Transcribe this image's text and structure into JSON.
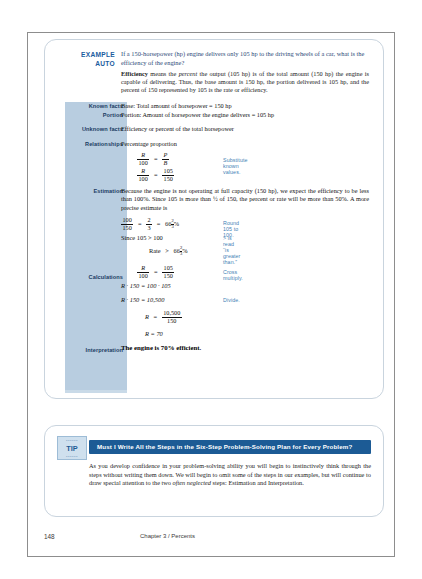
{
  "page": {
    "number": "148",
    "chapter_line": "Chapter 3 / Percents"
  },
  "example": {
    "tag_line1": "EXAMPLE",
    "tag_line2": "AUTO",
    "question": "If a 150-horsepower (hp) engine delivers only 105 hp to the driving wheels of a car, what is the efficiency of the engine?",
    "intro_bold": "Efficiency",
    "intro_rest_a": " means the ",
    "intro_italic": "percent",
    "intro_rest_b": " the output (105 hp) is of the total amount (150 hp) the engine is capable of delivering. Thus, the base amount is 150 hp, the portion delivered is 105 hp, and the percent of 150 represented by 105 is the rate or efficiency.",
    "labels": {
      "known_facts": "Known facts",
      "portion": "Portion",
      "unknown_facts": "Unknown facts",
      "relationships": "Relationships",
      "estimation": "Estimation",
      "calculations": "Calculations",
      "interpretation": "Interpretation"
    },
    "known_facts_text": "Base: Total amount of horsepower = 150 hp",
    "portion_text": "Portion: Amount of horsepower the engine delivers = 105 hp",
    "unknown_facts_text": "Efficiency or percent of the total horsepower",
    "relationships_text": "Percentage proportion",
    "proportion_1": {
      "left_num": "R",
      "left_den": "100",
      "eq": "=",
      "right_num": "P",
      "right_den": "B"
    },
    "proportion_2": {
      "left_num": "R",
      "left_den": "100",
      "eq": "=",
      "right_num": "105",
      "right_den": "150"
    },
    "note_substitute": "Substitute known values.",
    "estimation_text": "Because the engine is not operating at full capacity (150 hp), we expect the efficiency to be less than 100%. Since 105 is more than ½ of 150, the percent or rate will be more than 50%. A more precise estimate is",
    "estimate_eq": {
      "a_num": "100",
      "a_den": "150",
      "eq1": "=",
      "b_num": "2",
      "b_den": "3",
      "eq2": "=",
      "whole": "66",
      "m_num": "2",
      "m_den": "3",
      "pct": "%"
    },
    "note_round": "Round 105 to 100.",
    "since_line": "Since 105 > 100",
    "note_greater": "> is read “is greater than.”",
    "rate_line": {
      "label": "Rate",
      "gt": ">",
      "whole": "66",
      "m_num": "2",
      "m_den": "3",
      "pct": "%"
    },
    "calc_proportion": {
      "left_num": "R",
      "left_den": "100",
      "eq": "=",
      "right_num": "105",
      "right_den": "150"
    },
    "note_cross": "Cross multiply.",
    "calc_line_1": "R · 150 = 100 · 105",
    "calc_line_2": "R · 150 = 10,500",
    "note_divide": "Divide.",
    "calc_frac": {
      "var": "R",
      "eq": "=",
      "num": "10,500",
      "den": "150"
    },
    "calc_result": "R = 70",
    "interpretation_text": "The engine is 70% efficient."
  },
  "tip": {
    "badge_word": "TIP",
    "badge_tick_top": "••••••",
    "badge_tick_bottom": "••••••",
    "heading": "Must I Write All the Steps in the Six-Step Problem-Solving Plan for Every Problem?",
    "body_a": "As you develop confidence in your problem-solving ability you will begin to instinctively think through the steps without writing them down. We will begin to omit some of the steps in our examples, but will continue to draw special attention to the two ",
    "body_italic": "often neglected",
    "body_b": " steps: Estimation and Interpretation."
  },
  "colors": {
    "rail_blue": "#b8cde0",
    "heading_blue": "#1c5b95",
    "note_blue": "#3f7fb5",
    "question_blue": "#2c4a78"
  }
}
